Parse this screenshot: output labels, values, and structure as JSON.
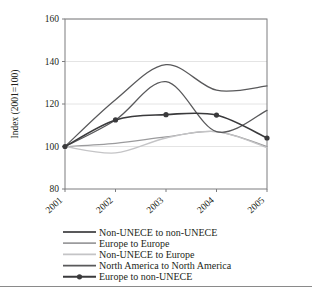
{
  "chart_data": {
    "type": "line",
    "title": "",
    "xlabel": "",
    "ylabel": "Index (2001=100)",
    "x": [
      "2001",
      "2002",
      "2003",
      "2004",
      "2005"
    ],
    "xtick_labels": [
      "2001",
      "2002",
      "2003",
      "2004",
      "2005"
    ],
    "ytick_labels": [
      "80",
      "100",
      "120",
      "140",
      "160"
    ],
    "yticks": [
      80,
      100,
      120,
      140,
      160
    ],
    "ylim": [
      80,
      160
    ],
    "xlim": [
      "2001",
      "2005"
    ],
    "grid": "horizontal",
    "legend_position": "below",
    "series": [
      {
        "name": "Non-UNECE to non-UNECE",
        "values": [
          100,
          122,
          138.5,
          126.5,
          128.5
        ],
        "color": "#59595b",
        "width": 1.3,
        "marker": "none"
      },
      {
        "name": "Europe to Europe",
        "values": [
          100,
          101.5,
          104.5,
          107,
          100
        ],
        "color": "#9b9b9d",
        "width": 1.2,
        "marker": "none"
      },
      {
        "name": "Non-UNECE to Europe",
        "values": [
          100,
          97,
          104,
          107,
          99.5
        ],
        "color": "#c4c4c6",
        "width": 1.3,
        "marker": "none"
      },
      {
        "name": "North America to North America",
        "values": [
          100,
          112.5,
          130.5,
          107,
          117
        ],
        "color": "#59595b",
        "width": 1.3,
        "marker": "none"
      },
      {
        "name": "Europe to non-UNECE",
        "values": [
          100,
          112.5,
          115,
          114.8,
          104
        ],
        "color": "#3a3a3c",
        "width": 1.6,
        "marker": "circle"
      }
    ]
  },
  "legend": {
    "items": [
      {
        "label": "Non-UNECE to non-UNECE"
      },
      {
        "label": "Europe to Europe"
      },
      {
        "label": "Non-UNECE to Europe"
      },
      {
        "label": "North America to North America"
      },
      {
        "label": "Europe to non-UNECE"
      }
    ]
  },
  "axes": {
    "y_title": "Index (2001=100)"
  },
  "colors": {
    "frame": "#7d7d7f",
    "grid": "#e4e4e4",
    "text": "#231f20"
  }
}
